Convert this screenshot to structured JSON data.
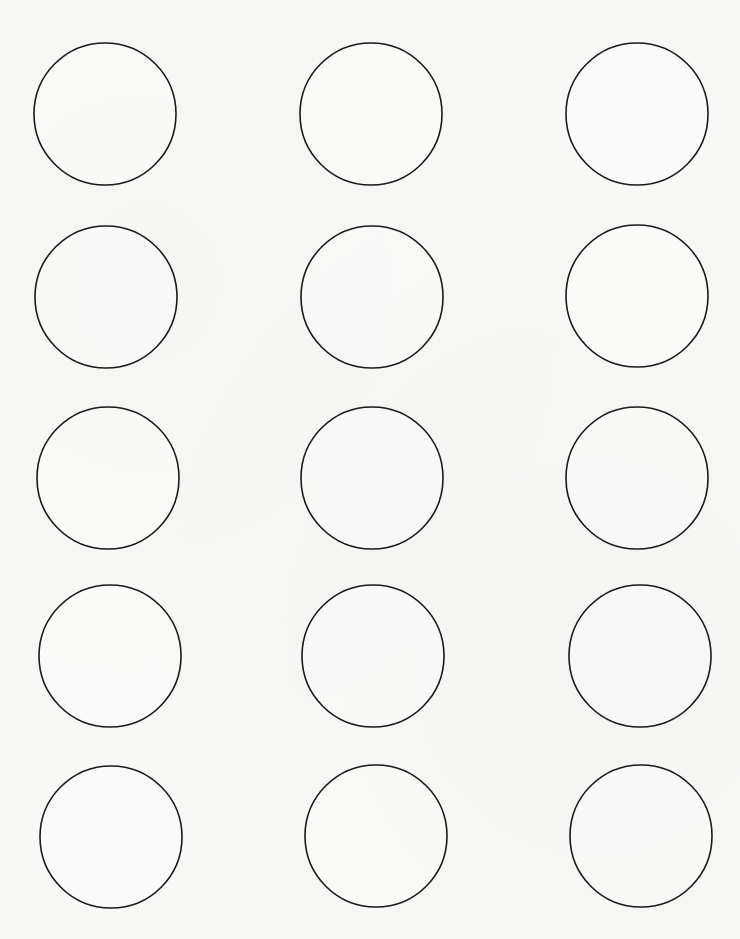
{
  "document": {
    "type": "round-label-template",
    "background_color": "#f8f8f7",
    "outline_color": "#1a1a1a",
    "grid": {
      "rows": 5,
      "columns": 3
    },
    "label_radius_px": 71,
    "column_centers_x": [
      105,
      371,
      637
    ],
    "row_centers_y": [
      114,
      297,
      478,
      656,
      837
    ],
    "labels": [
      {
        "row": 1,
        "col": 1,
        "cx": 105,
        "cy": 114,
        "text": ""
      },
      {
        "row": 1,
        "col": 2,
        "cx": 371,
        "cy": 114,
        "text": ""
      },
      {
        "row": 1,
        "col": 3,
        "cx": 637,
        "cy": 114,
        "text": ""
      },
      {
        "row": 2,
        "col": 1,
        "cx": 106,
        "cy": 297,
        "text": ""
      },
      {
        "row": 2,
        "col": 2,
        "cx": 372,
        "cy": 297,
        "text": ""
      },
      {
        "row": 2,
        "col": 3,
        "cx": 637,
        "cy": 296,
        "text": ""
      },
      {
        "row": 3,
        "col": 1,
        "cx": 108,
        "cy": 478,
        "text": ""
      },
      {
        "row": 3,
        "col": 2,
        "cx": 372,
        "cy": 478,
        "text": ""
      },
      {
        "row": 3,
        "col": 3,
        "cx": 637,
        "cy": 478,
        "text": ""
      },
      {
        "row": 4,
        "col": 1,
        "cx": 110,
        "cy": 656,
        "text": ""
      },
      {
        "row": 4,
        "col": 2,
        "cx": 373,
        "cy": 656,
        "text": ""
      },
      {
        "row": 4,
        "col": 3,
        "cx": 640,
        "cy": 656,
        "text": ""
      },
      {
        "row": 5,
        "col": 1,
        "cx": 111,
        "cy": 837,
        "text": ""
      },
      {
        "row": 5,
        "col": 2,
        "cx": 376,
        "cy": 836,
        "text": ""
      },
      {
        "row": 5,
        "col": 3,
        "cx": 641,
        "cy": 836,
        "text": ""
      }
    ]
  }
}
